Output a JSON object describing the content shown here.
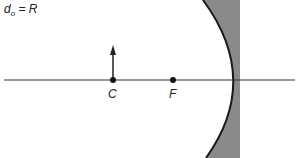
{
  "diagram": {
    "title": {
      "d": "d",
      "sub": "o",
      "rest": " = R"
    },
    "labels": {
      "center": "C",
      "focal": "F"
    },
    "objects": {
      "arrow": {
        "x": 113,
        "base_y": 80,
        "tip_y": 46
      },
      "points": [
        {
          "name": "C",
          "x": 113,
          "y": 80
        },
        {
          "name": "F",
          "x": 173,
          "y": 80
        }
      ],
      "mirror": {
        "type": "concave",
        "vertex_x": 232,
        "back_x": 240
      },
      "axis": {
        "y": 80,
        "x_start": 4,
        "x_end": 295
      }
    },
    "colors": {
      "line": "#333333",
      "mirror_fill": "#8a8a8a",
      "mirror_edge": "#1a1a1a"
    }
  }
}
